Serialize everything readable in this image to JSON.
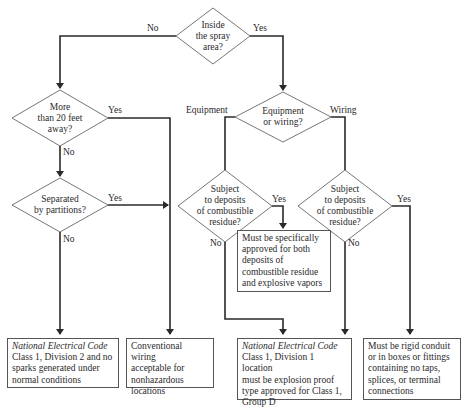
{
  "decisions": {
    "spray": {
      "lines": [
        "Inside",
        "the spray",
        "area?"
      ],
      "no": "No",
      "yes": "Yes"
    },
    "distance": {
      "lines": [
        "More",
        "than 20 feet",
        "away?"
      ],
      "no": "No",
      "yes": "Yes"
    },
    "partitions": {
      "lines": [
        "Separated",
        "by partitions?"
      ],
      "no": "No",
      "yes": "Yes"
    },
    "equip_wiring": {
      "lines": [
        "Equipment",
        "or wiring?"
      ],
      "left": "Equipment",
      "right": "Wiring"
    },
    "deposits_equip": {
      "lines": [
        "Subject",
        "to deposits",
        "of combustible",
        "residue?"
      ],
      "no": "No",
      "yes": "Yes"
    },
    "deposits_wiring": {
      "lines": [
        "Subject",
        "to deposits",
        "of combustible",
        "residue?"
      ],
      "no": "No",
      "yes": "Yes"
    }
  },
  "outcomes": {
    "div2": {
      "title": "National Electrical Code",
      "lines": [
        "Class 1, Division 2 and no",
        "sparks generated under",
        "normal conditions"
      ]
    },
    "conventional": {
      "lines": [
        "Conventional wiring",
        "acceptable for",
        "nonhazardous",
        "locations"
      ]
    },
    "approved_both": {
      "lines": [
        "Must be specifically",
        "approved for both",
        "deposits of",
        "combustible residue",
        "and explosive vapors"
      ]
    },
    "div1": {
      "title": "National Electrical Code",
      "lines": [
        "Class 1, Division 1 location",
        "must be explosion proof",
        "type approved for Class 1,",
        "Group D"
      ]
    },
    "rigid": {
      "lines": [
        "Must be rigid conduit",
        "or in boxes or fittings",
        "containing no taps,",
        "splices, or terminal",
        "connections"
      ]
    }
  },
  "colors": {
    "line": "#2a2a2a",
    "shape": "#555555",
    "background": "#ffffff"
  }
}
